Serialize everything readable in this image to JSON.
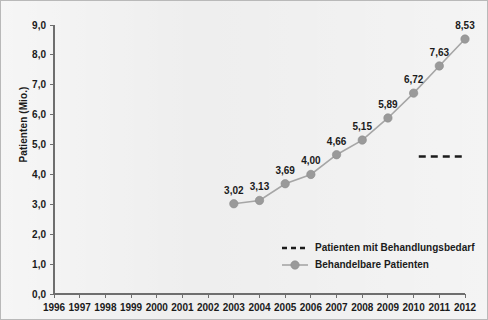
{
  "chart_data": {
    "type": "line",
    "title": "",
    "xlabel": "",
    "ylabel": "Patienten (Mio.)",
    "x": [
      1996,
      1997,
      1998,
      1999,
      2000,
      2001,
      2002,
      2003,
      2004,
      2005,
      2006,
      2007,
      2008,
      2009,
      2010,
      2011,
      2012
    ],
    "xtick_labels": [
      "1996",
      "1997",
      "1998",
      "1999",
      "2000",
      "2001",
      "2002",
      "2003",
      "2004",
      "2005",
      "2006",
      "2007",
      "2008",
      "2009",
      "2010",
      "2011",
      "2012"
    ],
    "ytick_labels": [
      "0,0",
      "1,0",
      "2,0",
      "3,0",
      "4,0",
      "5,0",
      "6,0",
      "7,0",
      "8,0",
      "9,0"
    ],
    "ytick_values": [
      0,
      1,
      2,
      3,
      4,
      5,
      6,
      7,
      8,
      9
    ],
    "ylim": [
      0,
      9
    ],
    "xlim": [
      1996,
      2012
    ],
    "grid": false,
    "legend_position": "inside-lower-right",
    "series": [
      {
        "name": "Behandelbare Patienten",
        "style": "line-markers",
        "color": "#9a9a9a",
        "x": [
          2003,
          2004,
          2005,
          2006,
          2007,
          2008,
          2009,
          2010,
          2011,
          2012
        ],
        "values": [
          3.02,
          3.13,
          3.69,
          4.0,
          4.66,
          5.15,
          5.89,
          6.72,
          7.63,
          8.53
        ],
        "data_labels": [
          "3,02",
          "3,13",
          "3,69",
          "4,00",
          "4,66",
          "5,15",
          "5,89",
          "6,72",
          "7,63",
          "8,53"
        ]
      },
      {
        "name": "Patienten mit Behandlungsbedarf",
        "style": "dashed-reference",
        "color": "#1b1b1b",
        "x_start": 2010.2,
        "x_end": 2012.0,
        "value": 4.6
      }
    ],
    "legend": [
      {
        "label": "Patienten mit Behandlungsbedarf",
        "marker": "dashed-line",
        "color": "#1b1b1b"
      },
      {
        "label": "Behandelbare Patienten",
        "marker": "line-circle",
        "color": "#9a9a9a"
      }
    ]
  },
  "colors": {
    "background": "#ebebeb",
    "axis": "#6e6e6e",
    "text": "#1b1b1b",
    "series": "#9a9a9a",
    "reference": "#1b1b1b"
  }
}
